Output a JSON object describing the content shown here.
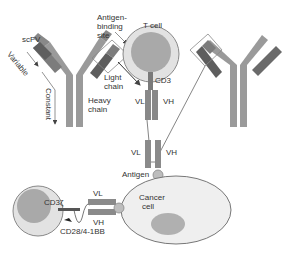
{
  "diagram": {
    "labels": {
      "scfv": "scFV",
      "variable": "Variable",
      "constant": "Constant",
      "antigen_binding_site": [
        "Antigen-",
        "binding",
        "site"
      ],
      "light_chain": [
        "Light",
        "chain"
      ],
      "heavy_chain": [
        "Heavy",
        "chain"
      ],
      "t_cell": "T cell",
      "cd3_top": "CD3",
      "vl_top": "VL",
      "vh_top": "VH",
      "vl_mid": "VL",
      "vh_mid": "VH",
      "antigen": "Antigen",
      "cancer_cell": [
        "Cancer",
        "cell"
      ],
      "cd3_bottom": "CD3ζ",
      "vl_bottom": "VL",
      "vh_bottom": "VH",
      "costim": "CD28/4-1BB"
    },
    "colors": {
      "heavy_chain": "#9a9a9a",
      "light_chain_constant": "#8c8c8c",
      "variable_dark": "#5e5e5e",
      "cell_outer": "#e2e2e2",
      "nucleus": "#a9a9a9",
      "cell_border": "#777777",
      "outline_box": "#888888"
    }
  }
}
